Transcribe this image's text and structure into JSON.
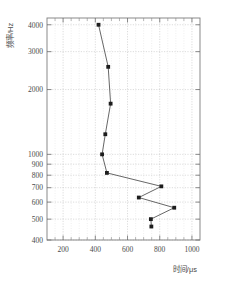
{
  "figure": {
    "background_color": "#ffffff",
    "line_color": "#4b4b4b",
    "marker_color": "#1d1d1d",
    "grid_color": "#b9b9b9",
    "frame_color": "#7d7d7d"
  },
  "chart_data": {
    "type": "line",
    "title": "",
    "subtitle": "",
    "xlabel": "时间/μs",
    "ylabel": "频率/Hz",
    "xscale": "linear",
    "yscale": "log",
    "xlim": [
      100,
      1050
    ],
    "ylim": [
      400,
      4300
    ],
    "grid": true,
    "legend": null,
    "xticks": [
      200,
      400,
      600,
      800,
      1000
    ],
    "xtick_labels": [
      "200",
      "400",
      "600",
      "800",
      "1000"
    ],
    "xminor_ticks": [
      100,
      150,
      250,
      300,
      350,
      450,
      500,
      550,
      650,
      700,
      750,
      850,
      900,
      950,
      1050
    ],
    "yticks": [
      400,
      500,
      600,
      700,
      800,
      900,
      1000,
      2000,
      3000,
      4000
    ],
    "ytick_labels": [
      "400",
      "500",
      "600",
      "700",
      "800",
      "900",
      "1000",
      "2000",
      "3000",
      "4000"
    ],
    "markers": "filled-square",
    "series": [
      {
        "name": "",
        "x": [
          420,
          480,
          495,
          462,
          442,
          472,
          810,
          670,
          890,
          745,
          748
        ],
        "y": [
          4000,
          2550,
          1720,
          1240,
          1000,
          820,
          710,
          630,
          565,
          500,
          462
        ],
        "points": [
          {
            "time_us": 420,
            "freq_hz": 4000
          },
          {
            "time_us": 480,
            "freq_hz": 2550
          },
          {
            "time_us": 495,
            "freq_hz": 1720
          },
          {
            "time_us": 462,
            "freq_hz": 1240
          },
          {
            "time_us": 442,
            "freq_hz": 1000
          },
          {
            "time_us": 472,
            "freq_hz": 820
          },
          {
            "time_us": 810,
            "freq_hz": 710
          },
          {
            "time_us": 670,
            "freq_hz": 630
          },
          {
            "time_us": 890,
            "freq_hz": 565
          },
          {
            "time_us": 745,
            "freq_hz": 500
          },
          {
            "time_us": 748,
            "freq_hz": 462
          }
        ]
      }
    ]
  }
}
